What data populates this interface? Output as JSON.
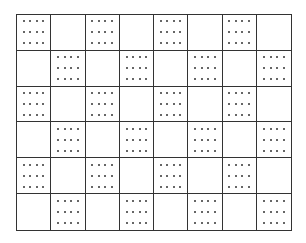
{
  "diagram": {
    "title": "",
    "grid": {
      "rows": 6,
      "cols": 8,
      "line_color": "#333333",
      "dot_color": "#333333",
      "pattern": "checkerboard",
      "dots_per_cell": {
        "cols": 4,
        "rows": 3
      },
      "cells": [
        [
          "dotted",
          "blank",
          "dotted",
          "blank",
          "dotted",
          "blank",
          "dotted",
          "blank"
        ],
        [
          "blank",
          "dotted",
          "blank",
          "dotted",
          "blank",
          "dotted",
          "blank",
          "dotted"
        ],
        [
          "dotted",
          "blank",
          "dotted",
          "blank",
          "dotted",
          "blank",
          "dotted",
          "blank"
        ],
        [
          "blank",
          "dotted",
          "blank",
          "dotted",
          "blank",
          "dotted",
          "blank",
          "dotted"
        ],
        [
          "dotted",
          "blank",
          "dotted",
          "blank",
          "dotted",
          "blank",
          "dotted",
          "blank"
        ],
        [
          "blank",
          "dotted",
          "blank",
          "dotted",
          "blank",
          "dotted",
          "blank",
          "dotted"
        ]
      ]
    }
  }
}
